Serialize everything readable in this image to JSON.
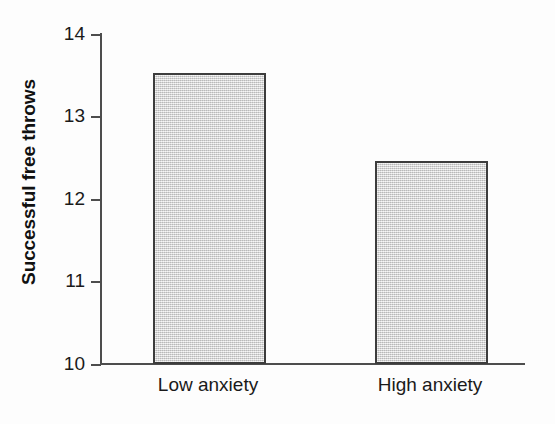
{
  "chart_data": {
    "type": "bar",
    "title": "",
    "subtitle": "",
    "xlabel": "",
    "ylabel": "Successful free throws",
    "categories": [
      "Low anxiety",
      "High anxiety"
    ],
    "values": [
      13.52,
      12.45
    ],
    "series": [
      {
        "name": "Successful free throws",
        "values": [
          13.52,
          12.45
        ]
      }
    ],
    "ylim": [
      10,
      14
    ],
    "yticks": [
      10,
      11,
      12,
      13,
      14
    ],
    "ytick_labels": [
      "10",
      "11",
      "12",
      "13",
      "14"
    ],
    "xticks": [],
    "grid": false,
    "legend": false,
    "legend_position": "none",
    "annotations": [],
    "colors": {
      "bar_fill": "#dcdcdc",
      "bar_border": "#3d3d3d",
      "axis": "#4d4d4d",
      "text": "#1a1a1a",
      "background": "#fdfdfd"
    }
  },
  "axis": {
    "y_title": "Successful free throws",
    "y_tick_labels": [
      "14",
      "13",
      "12",
      "11",
      "10"
    ]
  },
  "bars": [
    {
      "label": "Low anxiety",
      "value": "13.52"
    },
    {
      "label": "High anxiety",
      "value": "12.45"
    }
  ]
}
